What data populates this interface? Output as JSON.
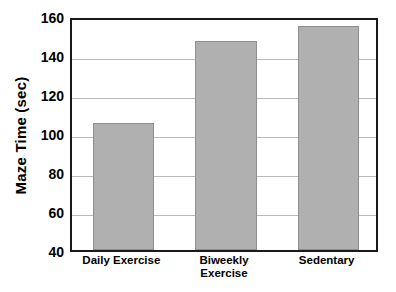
{
  "chart_data": {
    "type": "bar",
    "title": "",
    "xlabel": "",
    "ylabel": "Maze Time (sec)",
    "categories": [
      "Daily Exercise",
      "Biweekly Exercise",
      "Sedentary"
    ],
    "category_lines": [
      [
        "Daily Exercise"
      ],
      [
        "Biweekly",
        "Exercise"
      ],
      [
        "Sedentary"
      ]
    ],
    "values": [
      105,
      147,
      155
    ],
    "ylim": [
      40,
      160
    ],
    "ytick_step": 20,
    "yticks": [
      40,
      60,
      80,
      100,
      120,
      140,
      160
    ],
    "ytick_labels": [
      "40",
      "60",
      "80",
      "100",
      "120",
      "140",
      "160"
    ],
    "gridlines": [
      60,
      80,
      100,
      120,
      140
    ],
    "grid": true,
    "legend": false,
    "legend_position": "none",
    "bar_color": "#b0b0b0",
    "bar_edge_color": "#8e8e8e",
    "frame_color": "#1a1a1a",
    "grid_color": "#b9b9b9",
    "background": "#ffffff"
  }
}
